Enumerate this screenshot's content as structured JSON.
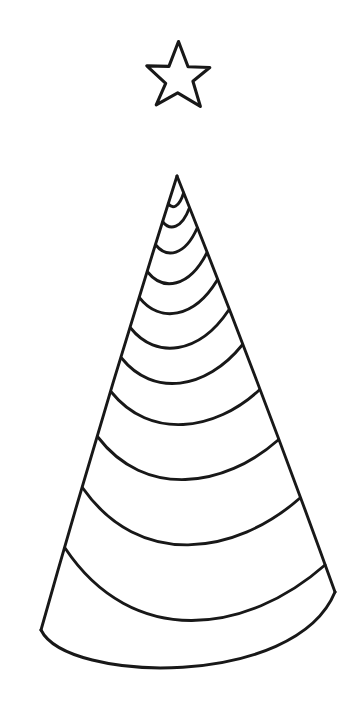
{
  "canvas": {
    "width": 353,
    "height": 721,
    "background_color": "#ffffff",
    "ink_color": "#181818",
    "title": "Christmas Tree Line Drawing"
  },
  "artwork": {
    "name": "christmas-tree-with-star",
    "style": "black-and-white line art / coloring page",
    "description": "Outline drawing of a conical Christmas tree wrapped in a continuous spiral garland, topped by a five-pointed star"
  },
  "star": {
    "name": "tree-topper-star",
    "points": 5,
    "center_x": 178.5,
    "center_y": 77.5,
    "outer_radius": 34.5,
    "inner_radius": 14.2,
    "rotation_deg": -90,
    "bounds": {
      "left": 144,
      "top": 45,
      "right": 213,
      "bottom": 110
    },
    "fill_color": "#ffffff",
    "stroke_color": "#181818",
    "stroke_width": 3.1,
    "vertex_jitter": [
      [
        0.0,
        -1.5
      ],
      [
        1.2,
        0.8
      ],
      [
        -1.5,
        0.6
      ],
      [
        0.9,
        -0.7
      ],
      [
        1.6,
        1.0
      ],
      [
        -0.8,
        1.2
      ],
      [
        -2.0,
        -0.6
      ],
      [
        0.7,
        1.4
      ],
      [
        1.1,
        -1.0
      ],
      [
        -1.2,
        0.4
      ]
    ]
  },
  "cone": {
    "name": "tree-cone-body",
    "apex_x": 177,
    "apex_y": 176,
    "base_center_x": 187,
    "base_center_y": 612,
    "base_radius_x": 148,
    "base_radius_y": 66,
    "left_edge_end_x": 41,
    "left_edge_end_y": 630,
    "right_edge_end_x": 335,
    "right_edge_end_y": 592,
    "base_lowest_y": 679,
    "stroke_width": 2.9
  },
  "garland": {
    "name": "spiral-garland",
    "turns": 11,
    "stroke_width": 2.9,
    "left_contact_points_y": [
      204,
      222,
      245,
      272,
      298,
      328,
      358,
      392,
      437,
      488,
      548
    ],
    "right_contact_points_y": [
      193,
      208,
      228,
      253,
      280,
      310,
      345,
      390,
      440,
      498,
      565
    ],
    "arc_sag_ratio": 0.44,
    "description": "Continuous spiral wrapping the cone; each visible arc sweeps from the left silhouette edge down and across to the right silhouette edge"
  }
}
